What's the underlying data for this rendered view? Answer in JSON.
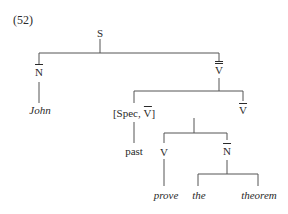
{
  "example_number": "(52)",
  "tree": {
    "root": {
      "label": "S"
    },
    "nodes": {
      "subject_np": {
        "label": "N",
        "bars": 1
      },
      "subject_word": {
        "label": "John"
      },
      "vp_top": {
        "label": "V",
        "bars": 2
      },
      "spec": {
        "label_pre": "[Spec, ",
        "label_cat": "V",
        "label_post": "]",
        "cat_bars": 1
      },
      "spec_word": {
        "label": "past"
      },
      "vbar": {
        "label": "V",
        "bars": 1
      },
      "verb": {
        "label": "V"
      },
      "verb_word": {
        "label": "prove"
      },
      "object_np": {
        "label": "N",
        "bars": 1
      },
      "det_word": {
        "label": "the"
      },
      "noun_word": {
        "label": "theorem"
      }
    }
  }
}
